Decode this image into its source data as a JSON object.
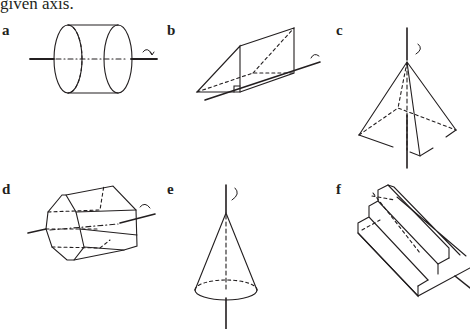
{
  "caption": "given axis.",
  "figures": [
    {
      "label": "a",
      "shape": "cylinder",
      "axis": "horizontal through centre"
    },
    {
      "label": "b",
      "shape": "triangular prism",
      "axis": "along bottom edge"
    },
    {
      "label": "c",
      "shape": "square pyramid",
      "axis": "vertical through apex"
    },
    {
      "label": "d",
      "shape": "octagonal prism",
      "axis": "horizontal through centre"
    },
    {
      "label": "e",
      "shape": "cone",
      "axis": "vertical through apex"
    },
    {
      "label": "f",
      "shape": "stepped prism",
      "axis": "diagonal through top step"
    }
  ],
  "colors": {
    "ink": "#231f20",
    "background": "#ffffff"
  }
}
